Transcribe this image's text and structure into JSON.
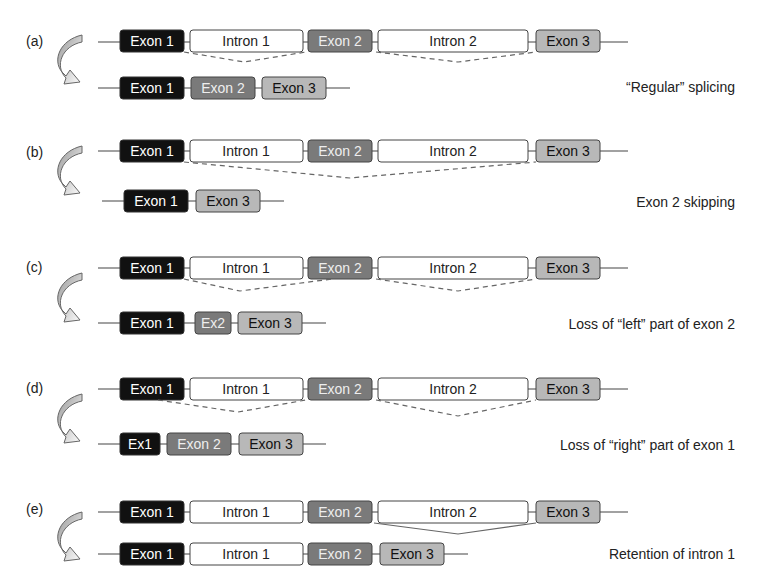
{
  "colors": {
    "exon1": "#111111",
    "exon2": "#7a7a7a",
    "exon3": "#b8b8b8",
    "intron": "#ffffff",
    "line": "#444444",
    "dash": "#666666"
  },
  "panels": [
    {
      "label": "(a)",
      "caption": "“Regular” splicing",
      "pre": [
        "Exon 1",
        "Intron 1",
        "Exon 2",
        "Intron 2",
        "Exon 3"
      ],
      "post": [
        "Exon 1",
        "Exon 2",
        "Exon 3"
      ]
    },
    {
      "label": "(b)",
      "caption": "Exon 2 skipping",
      "pre": [
        "Exon 1",
        "Intron 1",
        "Exon 2",
        "Intron 2",
        "Exon 3"
      ],
      "post": [
        "Exon 1",
        "Exon 3"
      ]
    },
    {
      "label": "(c)",
      "caption": "Loss of “left” part of exon 2",
      "pre": [
        "Exon 1",
        "Intron 1",
        "Exon 2",
        "Intron 2",
        "Exon 3"
      ],
      "post": [
        "Exon 1",
        "Ex2",
        "Exon 3"
      ]
    },
    {
      "label": "(d)",
      "caption": "Loss of “right” part of exon 1",
      "pre": [
        "Exon 1",
        "Intron 1",
        "Exon 2",
        "Intron 2",
        "Exon 3"
      ],
      "post": [
        "Ex1",
        "Exon 2",
        "Exon 3"
      ]
    },
    {
      "label": "(e)",
      "caption": "Retention of intron 1",
      "pre": [
        "Exon 1",
        "Intron 1",
        "Exon 2",
        "Intron 2",
        "Exon 3"
      ],
      "post": [
        "Exon 1",
        "Intron 1",
        "Exon 2",
        "Exon 3"
      ]
    }
  ]
}
